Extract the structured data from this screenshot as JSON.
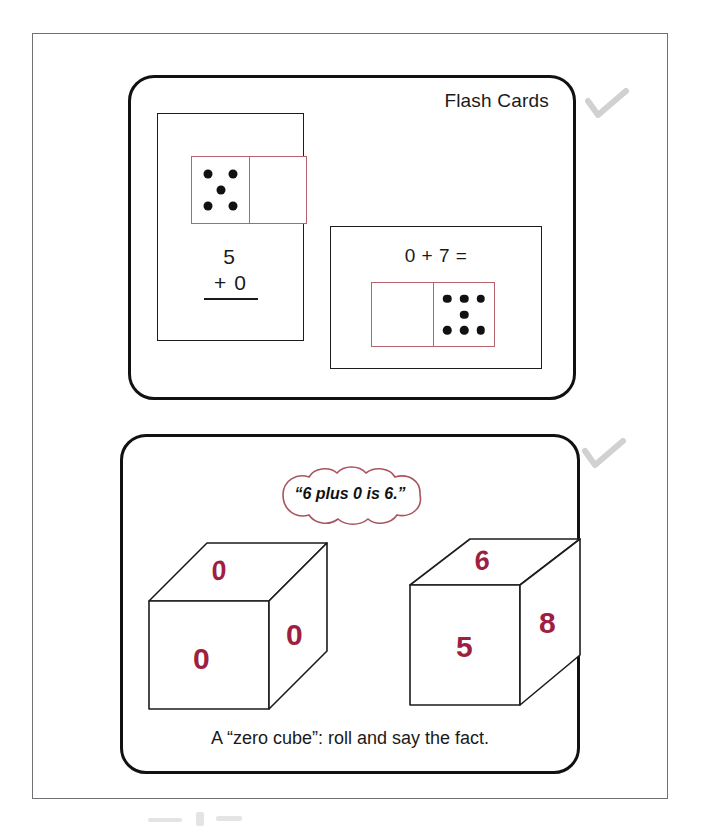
{
  "page": {
    "background_color": "#ffffff",
    "frame_color": "#6f7174"
  },
  "colors": {
    "ink": "#1a1a1a",
    "domino_border": "#b5646e",
    "cube_digit_red": "#9e2040",
    "cloud_outline": "#a85560",
    "pip_black": "#111111",
    "check_gray": "#9a9a9a"
  },
  "panels": [
    {
      "id": "flash-cards",
      "title": "Flash Cards",
      "cards": [
        {
          "id": "flash-card-1",
          "domino": {
            "left_pips": 5,
            "right_pips": 0,
            "left_pip_positions": [
              [
                28,
                26
              ],
              [
                72,
                26
              ],
              [
                50,
                50
              ],
              [
                28,
                74
              ],
              [
                72,
                74
              ]
            ],
            "right_pip_positions": []
          },
          "equation_format": "vertical",
          "equation_top": "5",
          "equation_bottom": "+ 0",
          "has_rule": true
        },
        {
          "id": "flash-card-2",
          "equation_format": "horizontal",
          "equation_text": "0 + 7 =",
          "domino": {
            "left_pips": 0,
            "right_pips": 7,
            "left_pip_positions": [],
            "right_pip_positions": [
              [
                22,
                25
              ],
              [
                50,
                25
              ],
              [
                78,
                25
              ],
              [
                50,
                50
              ],
              [
                22,
                75
              ],
              [
                50,
                75
              ],
              [
                78,
                75
              ]
            ]
          }
        }
      ]
    },
    {
      "id": "zero-cube",
      "speech_cloud_text": "“6 plus 0 is 6.”",
      "caption": "A “zero cube”:  roll and say the fact.",
      "cubes": [
        {
          "id": "cube-left",
          "front_face": "0",
          "side_face": "0",
          "top_face": "0"
        },
        {
          "id": "cube-right",
          "front_face": "5",
          "side_face": "8",
          "top_face": "6"
        }
      ]
    }
  ],
  "margin_marks": [
    {
      "id": "check-mark-1",
      "icon": "check-icon"
    },
    {
      "id": "check-mark-2",
      "icon": "check-icon"
    }
  ]
}
